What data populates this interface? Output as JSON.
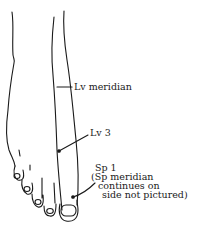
{
  "diagram": {
    "labels": {
      "lv_meridian": "Lv meridian",
      "lv3": "Lv 3",
      "sp1": "Sp 1",
      "sp1_note_line1": "(Sp meridian",
      "sp1_note_line2": "continues on",
      "sp1_note_line3": "side not pictured)"
    },
    "points": [
      {
        "name": "Lv 3",
        "x": 59,
        "y": 151
      },
      {
        "name": "Sp 1",
        "x": 73,
        "y": 197
      }
    ],
    "line_color": "#1a1a1a"
  }
}
